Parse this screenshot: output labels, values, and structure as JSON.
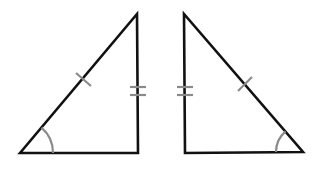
{
  "diagram": {
    "type": "congruent-right-triangles",
    "background": "#ffffff",
    "edge_color": "#111111",
    "mark_color": "#8a8a8a",
    "triangles": [
      {
        "name": "left-triangle",
        "vertices": [
          [
            20,
            153
          ],
          [
            137,
            14
          ],
          [
            138,
            153
          ]
        ],
        "right_angle_vertex": [
          138,
          153
        ],
        "single_tick": {
          "on": "hypotenuse",
          "center": [
            82,
            80
          ]
        },
        "double_tick": {
          "on": "vertical-leg",
          "y": [
            87,
            95
          ],
          "x": [
            130,
            146
          ]
        },
        "angle_arc": {
          "vertex": [
            20,
            153
          ],
          "radius": 33,
          "start_deg": -50,
          "end_deg": 0
        }
      },
      {
        "name": "right-triangle",
        "vertices": [
          [
            184,
            14
          ],
          [
            185,
            153
          ],
          [
            303,
            152
          ]
        ],
        "right_angle_vertex": [
          185,
          153
        ],
        "single_tick": {
          "on": "hypotenuse",
          "center": [
            244,
            84
          ]
        },
        "double_tick": {
          "on": "vertical-leg",
          "y": [
            87,
            95
          ],
          "x": [
            177,
            193
          ]
        },
        "angle_arc": {
          "vertex": [
            303,
            152
          ],
          "radius": 27,
          "start_deg": 180,
          "end_deg": 230
        }
      }
    ]
  }
}
